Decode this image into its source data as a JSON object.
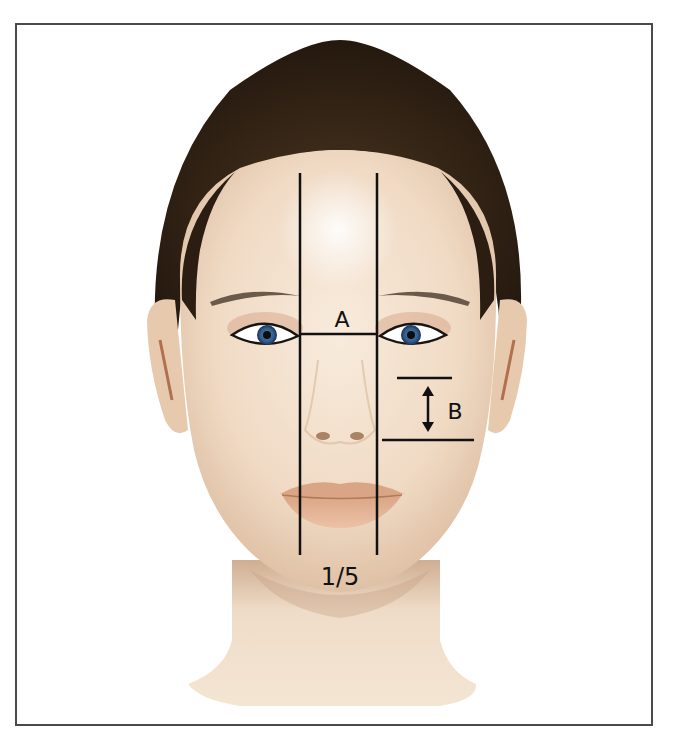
{
  "diagram": {
    "labels": {
      "a": "A",
      "b": "B",
      "fraction": "1/5"
    },
    "annotations": [
      {
        "id": "A",
        "description": "Horizontal segment across the eye line between the two vertical guides (intercanthal width)"
      },
      {
        "id": "B",
        "description": "Vertical distance marked by a double-headed arrow between two horizontal lines on the right cheek"
      },
      {
        "id": "1/5",
        "description": "Width between the two vertical guide lines equals one fifth of the face width"
      }
    ],
    "colors": {
      "line": "#111111",
      "frame": "#4a4a4a",
      "skin": "#f1dcc6",
      "skin_shadow": "#d9b89a",
      "hair": "#2b1d12",
      "iris": "#2f5a8a",
      "lips": "#e2b193",
      "background": "#ffffff"
    }
  }
}
